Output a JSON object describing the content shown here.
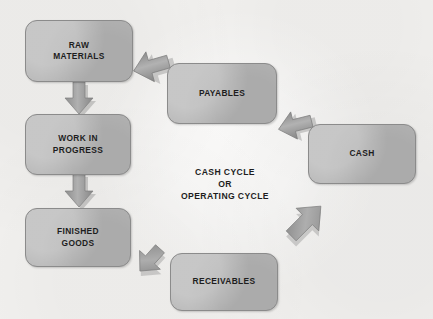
{
  "diagram": {
    "title_text": "CASH CYCLE\nOR\nOPERATING CYCLE",
    "colors": {
      "background": "#f2f1ef",
      "node_fill": "#b4b4b4",
      "node_border": "#8b8b8b",
      "arrow_fill": "#9a9a9a",
      "text": "#1d1d1d"
    },
    "nodes": [
      {
        "id": "raw-materials",
        "label": "RAW\nMATERIALS",
        "x": 25,
        "y": 20,
        "w": 108,
        "h": 62
      },
      {
        "id": "work-in-progress",
        "label": "WORK IN\nPROGRESS",
        "x": 25,
        "y": 114,
        "w": 106,
        "h": 61
      },
      {
        "id": "finished-goods",
        "label": "FINISHED\nGOODS",
        "x": 25,
        "y": 208,
        "w": 106,
        "h": 59
      },
      {
        "id": "receivables",
        "label": "RECEIVABLES",
        "x": 170,
        "y": 253,
        "w": 108,
        "h": 58
      },
      {
        "id": "cash",
        "label": "CASH",
        "x": 308,
        "y": 124,
        "w": 108,
        "h": 60
      },
      {
        "id": "payables",
        "label": "PAYABLES",
        "x": 167,
        "y": 63,
        "w": 110,
        "h": 61
      }
    ],
    "arrows": [
      {
        "id": "raw-to-wip",
        "from": "raw-materials",
        "to": "work-in-progress",
        "direction": "down"
      },
      {
        "id": "wip-to-finished",
        "from": "work-in-progress",
        "to": "finished-goods",
        "direction": "down"
      },
      {
        "id": "finished-to-recv",
        "from": "finished-goods",
        "to": "receivables",
        "direction": "down-right"
      },
      {
        "id": "recv-to-cash",
        "from": "receivables",
        "to": "cash",
        "direction": "up-right"
      },
      {
        "id": "cash-to-payables",
        "from": "cash",
        "to": "payables",
        "direction": "left"
      },
      {
        "id": "payables-to-raw",
        "from": "payables",
        "to": "raw-materials",
        "direction": "left"
      }
    ]
  }
}
